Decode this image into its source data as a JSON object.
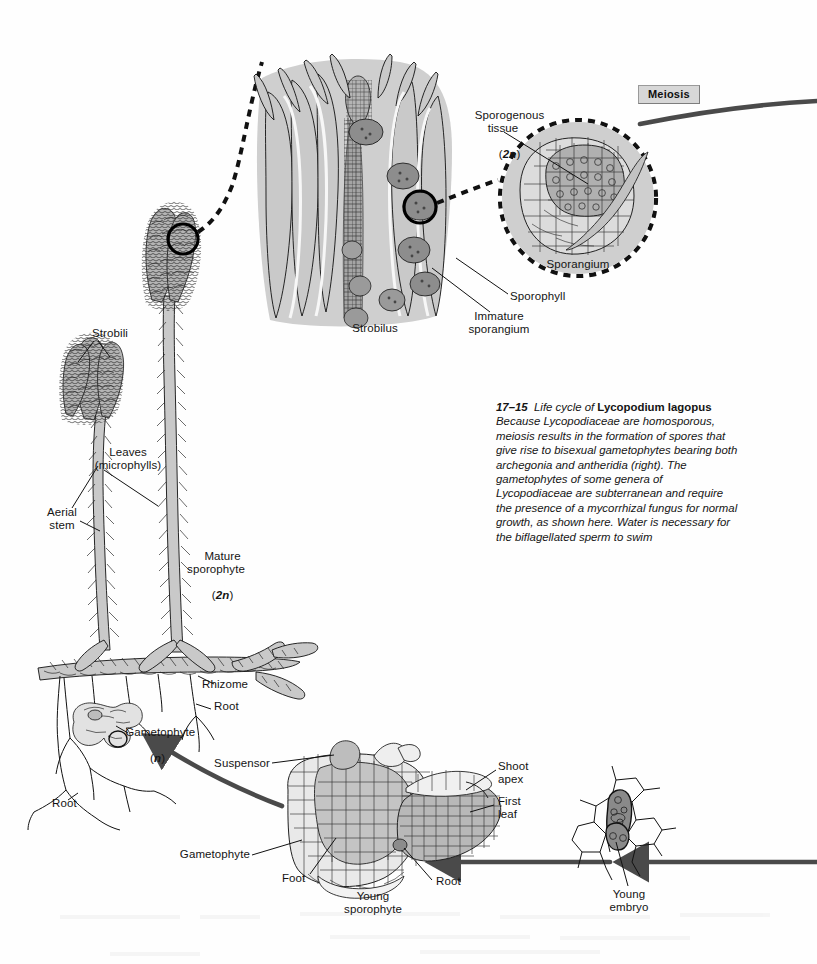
{
  "figure": {
    "number": "17–15",
    "title_lead": "Life cycle of",
    "species": "Lycopodium lagopus",
    "body": "Because Lycopodiaceae are homosporous, meiosis results in the formation of spores that give rise to bisexual gametophytes bearing both archegonia and antheridia (right). The gametophytes of some genera of Lycopodiaceae are subterranean and require the presence of a mycorrhizal fungus for normal growth, as shown here. Water is necessary for the biflagellated sperm to swim"
  },
  "process_labels": {
    "meiosis": "Meiosis"
  },
  "labels": {
    "sporogenous_tissue": "Sporogenous\ntissue",
    "sporogenous_ploidy": "2n",
    "sporangium": "Sporangium",
    "sporophyll": "Sporophyll",
    "immature_sporangium": "Immature\nsporangium",
    "strobilus": "Strobilus",
    "strobili": "Strobili",
    "leaves_microphylls": "Leaves\n(microphylls)",
    "aerial_stem": "Aerial\nstem",
    "mature_sporophyte": "Mature\nsporophyte",
    "mature_sporophyte_ploidy": "2n",
    "rhizome": "Rhizome",
    "root_upper": "Root",
    "gametophyte_plant": "Gametophyte",
    "gametophyte_ploidy": "n",
    "root_lower": "Root",
    "suspensor": "Suspensor",
    "shoot_apex": "Shoot\napex",
    "first_leaf": "First\nleaf",
    "gametophyte_embryo": "Gametophyte",
    "foot": "Foot",
    "root_embryo": "Root",
    "young_sporophyte": "Young\nsporophyte",
    "young_embryo": "Young\nembryo"
  },
  "colors": {
    "page_background": "#fefefe",
    "ink": "#111111",
    "tissue_gray": "#c9c9c9",
    "tissue_gray_dark": "#9d9d9d",
    "arrow_gray": "#4a4a4a",
    "meiosis_box": "#d7d7d7",
    "meiosis_box_border": "#9a9a9a",
    "text": "#141414"
  },
  "diagram": {
    "type": "life-cycle",
    "organism": "Lycopodium lagopus",
    "stages": [
      "Mature sporophyte (2n)",
      "Strobilus",
      "Sporangium with sporogenous tissue (2n)",
      "Meiosis",
      "Gametophyte (n)",
      "Young embryo",
      "Young sporophyte"
    ]
  }
}
